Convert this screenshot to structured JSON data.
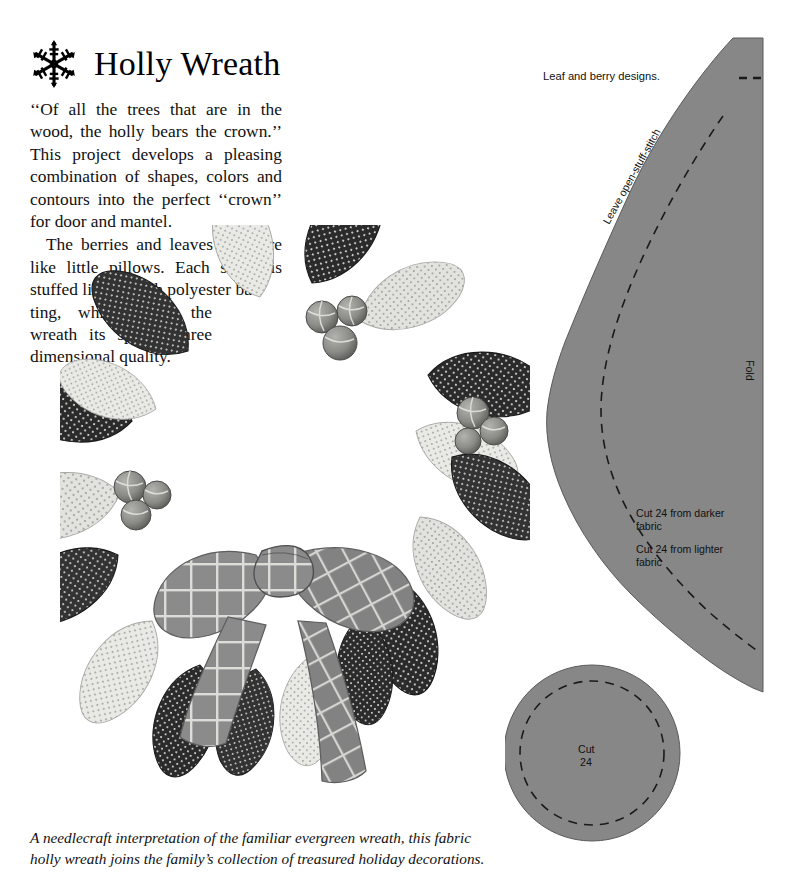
{
  "header": {
    "title": "Holly Wreath",
    "ornament_icon": "snowflake-icon"
  },
  "article": {
    "paragraph_1": "‘‘Of all the trees that are in the wood, the holly bears the crown.’’ This project develops a pleasing combination of shapes, colors and contours into the perfect ‘‘crown’’ for door and mantel.",
    "paragraph_2a": "The berries and leaves used are like little pillows. Each shape is stuffed lightly with polyester bat-",
    "paragraph_2b": "ting, which gives the wreath its special three dimensional quality."
  },
  "caption": {
    "line_1": "A needlecraft interpretation of the familiar evergreen wreath, this fabric",
    "line_2": "holly wreath joins the family’s collection of treasured holiday decorations."
  },
  "photo": {
    "alt": "Fabric holly wreath made of stuffed polka-dot leaf pillows with berry clusters and a plaid bow",
    "leaf_dark_color": "#2b2b2b",
    "leaf_light_color": "#e8e8e6",
    "berry_color": "#8d8d8d",
    "bow_color": "#8a8a8a"
  },
  "patterns": {
    "heading": "Leaf and berry designs.",
    "leaf": {
      "edge_label": "Leave open-stuff-stitch",
      "fold_label": "Fold",
      "cut_darker": "Cut 24 from darker",
      "cut_darker_2": "fabric",
      "cut_lighter": "Cut 24 from lighter",
      "cut_lighter_2": "fabric",
      "fill_color": "#878787"
    },
    "berry": {
      "cut_label": "Cut",
      "cut_count": "24",
      "fill_color": "#878787"
    }
  }
}
